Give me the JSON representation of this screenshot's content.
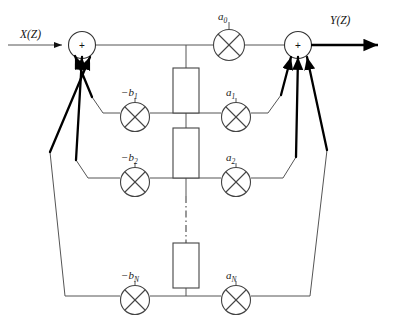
{
  "diagram": {
    "io": {
      "input_label": "X(Z)",
      "output_label": "Y(Z)"
    },
    "adders": [
      {
        "name": "input-summing-junction",
        "sign": "+"
      },
      {
        "name": "output-summing-junction",
        "sign": "+"
      }
    ],
    "feedforward_coefficients": [
      {
        "base": "a",
        "sub": "0"
      },
      {
        "base": "a",
        "sub": "1"
      },
      {
        "base": "a",
        "sub": "2"
      },
      {
        "base": "a",
        "sub": "N"
      }
    ],
    "feedback_coefficients": [
      {
        "base": "−b",
        "sub": "1"
      },
      {
        "base": "−b",
        "sub": "2"
      },
      {
        "base": "−b",
        "sub": "N"
      }
    ],
    "delay_blocks": [
      {
        "name": "delay-block-1",
        "label": ""
      },
      {
        "name": "delay-block-2",
        "label": ""
      },
      {
        "name": "delay-block-n",
        "label": ""
      }
    ],
    "ellipsis": {
      "name": "vertical-ellipsis",
      "style": "dash-dot"
    },
    "colors": {
      "line": "#555555",
      "arrow": "#000000",
      "text": "#111111",
      "background": "#ffffff"
    }
  }
}
